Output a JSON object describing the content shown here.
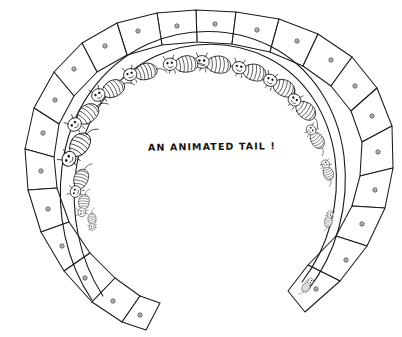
{
  "artwork": {
    "title": "An Animated Tail",
    "medium": "pen-and-ink line drawing",
    "background_color": "#ffffff",
    "ink_color": "#1a1a1a"
  },
  "caption": {
    "text": "AN  ANIMATED  TAIL !",
    "position": "center of the horseshoe opening"
  },
  "structure": {
    "form": "horseshoe / C-shaped fan of trapezoidal panels",
    "panel_count": 20,
    "hole_count": 20,
    "creature_count": 13,
    "opening_direction": "bottom"
  },
  "panels": [
    {
      "id": 1,
      "points": "196,10 196,10 236,12 232,44 197,42",
      "hole": [
        215,
        24
      ]
    },
    {
      "id": 2,
      "points": "236,12 279,19 270,52 232,44",
      "hole": [
        257,
        30
      ]
    },
    {
      "id": 3,
      "points": "279,19 318,34 303,66 270,52",
      "hole": [
        297,
        41
      ]
    },
    {
      "id": 4,
      "points": "318,34 352,57 331,86 303,66",
      "hole": [
        331,
        60
      ]
    },
    {
      "id": 5,
      "points": "352,57 377,88 351,111 331,86",
      "hole": [
        355,
        86
      ]
    },
    {
      "id": 6,
      "points": "377,88 392,126 362,142 351,111",
      "hole": [
        372,
        116
      ]
    },
    {
      "id": 7,
      "points": "392,126 393,168 360,176 362,142",
      "hole": [
        378,
        152
      ]
    },
    {
      "id": 8,
      "points": "393,168 385,208 352,206 360,176",
      "hole": [
        375,
        190
      ]
    },
    {
      "id": 9,
      "points": "385,208 367,246 336,236 352,206",
      "hole": [
        362,
        224
      ]
    },
    {
      "id": 10,
      "points": "367,246 340,281 308,265 336,236",
      "hole": [
        346,
        260
      ]
    },
    {
      "id": 11,
      "points": "340,281 305,312 288,291 308,265",
      "hole": [
        316,
        289
      ]
    },
    {
      "id": 12,
      "points": "196,10 157,13 162,45 197,42",
      "hole": [
        177,
        26
      ]
    },
    {
      "id": 13,
      "points": "157,13 117,23 127,55 162,45",
      "hole": [
        138,
        31
      ]
    },
    {
      "id": 14,
      "points": "117,23 82,43 97,72 127,55",
      "hole": [
        105,
        46
      ]
    },
    {
      "id": 15,
      "points": "82,43 54,72 74,96 97,72",
      "hole": [
        74,
        69
      ]
    },
    {
      "id": 16,
      "points": "54,72 34,108 59,124 74,96",
      "hole": [
        55,
        100
      ]
    },
    {
      "id": 17,
      "points": "34,108 25,149 54,157 59,124",
      "hole": [
        43,
        133
      ]
    },
    {
      "id": 18,
      "points": "25,149 28,190 57,188 54,157",
      "hole": [
        41,
        171
      ]
    },
    {
      "id": 19,
      "points": "28,190 41,232 69,222 57,188",
      "hole": [
        48,
        209
      ]
    },
    {
      "id": 20,
      "points": "41,232 64,271 90,253 69,222",
      "hole": [
        62,
        246
      ]
    },
    {
      "id": 21,
      "points": "64,271 92,302 115,278 90,253",
      "hole": [
        85,
        278
      ]
    },
    {
      "id": 22,
      "points": "92,302 122,322 140,296 115,278",
      "hole": [
        113,
        301
      ]
    },
    {
      "id": 23,
      "points": "122,322 146,330 160,303 140,296",
      "hole": [
        140,
        315
      ]
    }
  ],
  "creatures": [
    {
      "id": 1,
      "x": 204,
      "y": 62,
      "rot": 2,
      "scale": 1.0
    },
    {
      "id": 2,
      "x": 172,
      "y": 64,
      "rot": -8,
      "scale": 0.96
    },
    {
      "id": 3,
      "x": 241,
      "y": 68,
      "rot": 10,
      "scale": 0.96
    },
    {
      "id": 4,
      "x": 132,
      "y": 74,
      "rot": -18,
      "scale": 0.94
    },
    {
      "id": 5,
      "x": 272,
      "y": 81,
      "rot": 22,
      "scale": 0.94
    },
    {
      "id": 6,
      "x": 100,
      "y": 94,
      "rot": -30,
      "scale": 0.96
    },
    {
      "id": 7,
      "x": 296,
      "y": 101,
      "rot": 36,
      "scale": 0.92
    },
    {
      "id": 8,
      "x": 76,
      "y": 123,
      "rot": -46,
      "scale": 1.0
    },
    {
      "id": 9,
      "x": 312,
      "y": 131,
      "rot": 52,
      "scale": 0.72
    },
    {
      "id": 10,
      "x": 70,
      "y": 157,
      "rot": -60,
      "scale": 1.06
    },
    {
      "id": 11,
      "x": 326,
      "y": 165,
      "rot": 66,
      "scale": 0.58
    },
    {
      "id": 12,
      "x": 76,
      "y": 190,
      "rot": -74,
      "scale": 0.82
    },
    {
      "id": 13,
      "x": 82,
      "y": 211,
      "rot": -86,
      "scale": 0.62
    },
    {
      "id": 14,
      "x": 92,
      "y": 226,
      "rot": -98,
      "scale": 0.48
    },
    {
      "id": 15,
      "x": 330,
      "y": 215,
      "rot": 96,
      "scale": 0.46
    },
    {
      "id": 16,
      "x": 310,
      "y": 282,
      "rot": 118,
      "scale": 0.44
    }
  ]
}
